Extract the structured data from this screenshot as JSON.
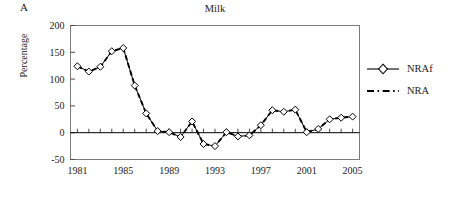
{
  "panel": {
    "label": "A"
  },
  "legend": {
    "position": "right",
    "entries": [
      {
        "label": "NRAf",
        "marker": "diamond-icon",
        "line": "solid",
        "color": "#000000"
      },
      {
        "label": "NRA",
        "marker": "none",
        "line": "dashed",
        "color": "#000000"
      }
    ]
  },
  "chart_data": {
    "type": "line",
    "title": "Milk",
    "xlabel": "",
    "ylabel": "Percentage",
    "grid": false,
    "xlim": [
      1980.4,
      2005.6
    ],
    "ylim": [
      -50,
      200
    ],
    "yticks": [
      -50,
      0,
      50,
      100,
      150,
      200
    ],
    "ytick_labels": [
      "-50",
      "0",
      "50",
      "100",
      "150",
      "200"
    ],
    "xticks": [
      1981,
      1985,
      1989,
      1993,
      1997,
      2001,
      2005
    ],
    "xtick_labels": [
      "1981",
      "1985",
      "1989",
      "1993",
      "1997",
      "2001",
      "2005"
    ],
    "x": [
      1981,
      1982,
      1983,
      1984,
      1985,
      1986,
      1987,
      1988,
      1989,
      1990,
      1991,
      1992,
      1993,
      1994,
      1995,
      1996,
      1997,
      1998,
      1999,
      2000,
      2001,
      2002,
      2003,
      2004,
      2005
    ],
    "series": [
      {
        "name": "NRAf",
        "marker": "diamond",
        "line": "solid",
        "values": [
          124,
          114,
          123,
          152,
          158,
          88,
          36,
          3,
          1,
          -8,
          21,
          -21,
          -25,
          1,
          -7,
          -5,
          14,
          42,
          39,
          43,
          1,
          7,
          25,
          28,
          30
        ]
      },
      {
        "name": "NRA",
        "marker": "none",
        "line": "dashed",
        "values": [
          124,
          114,
          123,
          152,
          158,
          88,
          36,
          3,
          1,
          -8,
          21,
          -21,
          -25,
          1,
          -7,
          -5,
          14,
          42,
          39,
          43,
          1,
          7,
          25,
          28,
          30
        ]
      }
    ]
  }
}
